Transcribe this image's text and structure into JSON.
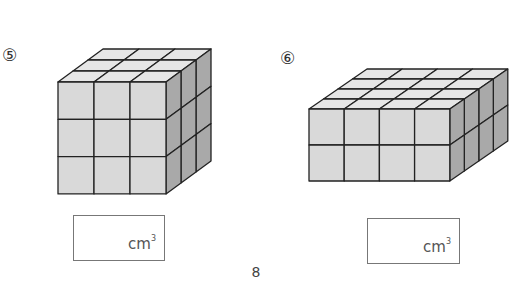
{
  "problems": [
    {
      "number": "⑤",
      "cubes": {
        "width": 3,
        "height": 3,
        "depth": 3
      },
      "answer_value": "",
      "unit": "cm",
      "unit_exp": "3"
    },
    {
      "number": "⑥",
      "cubes": {
        "width": 4,
        "height": 2,
        "depth": 4
      },
      "answer_value": "",
      "unit": "cm",
      "unit_exp": "3"
    }
  ],
  "page_number": "8",
  "colors": {
    "front_face": "#d9d9d9",
    "top_face": "#e6e6e6",
    "side_face": "#a9a9a9",
    "edge": "#222222"
  }
}
